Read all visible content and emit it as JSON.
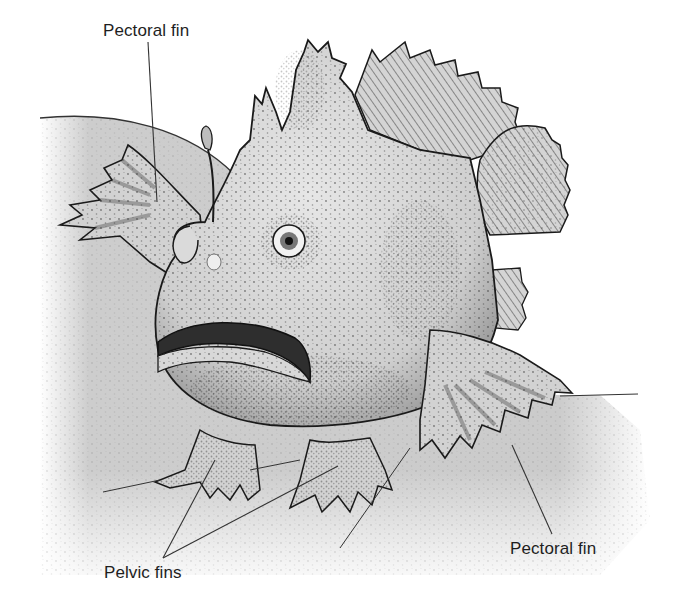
{
  "figure": {
    "labels": {
      "pectoral_fin_top": "Pectoral fin",
      "pectoral_fin_bottom": "Pectoral fin",
      "pelvic_fins": "Pelvic fins"
    },
    "colors": {
      "background": "#ffffff",
      "seabed": "#cfcfcf",
      "fish_body": "#d9d9d9",
      "stipple": "#2a2a2a",
      "outline": "#1a1a1a",
      "leader_line": "#333333",
      "label_text": "#1e1e1e"
    }
  }
}
